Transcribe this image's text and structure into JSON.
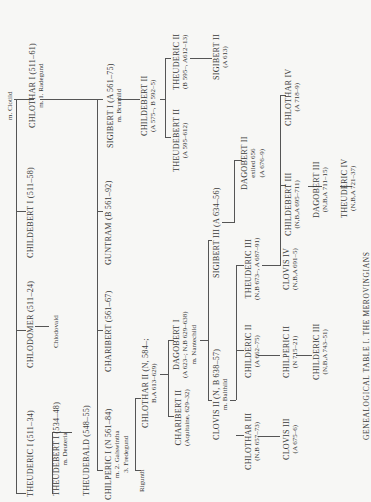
{
  "title": "GENEALOGICAL TABLE I. THE MEROVINGIANS",
  "root": {
    "marriage": "m. Clotild"
  },
  "nodes": {
    "theuderic1": {
      "name": "THEUDERIC I (511–34)"
    },
    "chlodomer": {
      "name": "CHLODOMER (511–24)"
    },
    "chlodovald": {
      "name": "Chlodovald"
    },
    "childebert1": {
      "name": "CHILDEBERT I (511–58)"
    },
    "chlothar1": {
      "name": "CHLOTHAR I (511–61)",
      "sub": "m. 1. Radegund"
    },
    "theudebert1": {
      "name": "THEUDEBERT I (534–48)",
      "sub": "m. Deuteria"
    },
    "theudebald": {
      "name": "THEUDEBALD (548–55)"
    },
    "chilperic1": {
      "name": "CHILPERIC I (N 561–84)",
      "sub": "m. 2. Galswintha",
      "sub2": "3. Fredegund"
    },
    "charibert1": {
      "name": "CHARIBERT (561–67)"
    },
    "guntram": {
      "name": "GUNTRAM (B 561–92)"
    },
    "sigibert1": {
      "name": "SIGIBERT I (A 561–75)",
      "sub": "m. Brunhild"
    },
    "rigunth": {
      "name": "Rigunth"
    },
    "chlothar2": {
      "name": "CHLOTHAR II (N, 584–;",
      "sub": "B,A 613–629)"
    },
    "childebert2": {
      "name": "CHILDEBERT II",
      "sub": "(A 575–, B 592–5)"
    },
    "theudebert2": {
      "name": "THEUDEBERT II",
      "sub": "(A 595–612)"
    },
    "theuderic2": {
      "name": "THEUDERIC II",
      "sub": "(B 595–, A612–13)"
    },
    "sigibert2": {
      "name": "SIGIBERT II",
      "sub": "(A 613)"
    },
    "charibert2": {
      "name": "CHARIBERT II",
      "sub": "(Aquitaine, 629–32)"
    },
    "dagobert1": {
      "name": "DAGOBERT I",
      "sub": "(A 623–; N,B 629–638)",
      "sub2": "m. Nantechild"
    },
    "clovis2": {
      "name": "CLOVIS II (N, B 638–57)",
      "sub": "m. Balthild"
    },
    "sigibert3": {
      "name": "SIGIBERT III (A 634–56)"
    },
    "dagobert2": {
      "name": "DAGOBERT II",
      "sub": "exiled 656",
      "sub2": "(A 676–9)"
    },
    "chlothar3": {
      "name": "CHLOTHAR III",
      "sub": "(N,B 657–73)"
    },
    "childeric2": {
      "name": "CHILDERIC II",
      "sub": "(A 662–75)"
    },
    "theuderic3": {
      "name": "THEUDERIC III",
      "sub": "(N,B 673–, A 687–91)"
    },
    "clovis3": {
      "name": "CLOVIS III",
      "sub": "(A 675–6)"
    },
    "chilperic2": {
      "name": "CHILPERIC II",
      "sub": "(N 715–21)"
    },
    "childeric3": {
      "name": "CHILDERIC III",
      "sub": "(N,B,A 743–51)"
    },
    "clovis4": {
      "name": "CLOVIS IV",
      "sub": "(N,B,A 691–5)"
    },
    "childebert3": {
      "name": "CHILDEBERT III",
      "sub": "(N,B,A 695–711)"
    },
    "dagobert3": {
      "name": "DAGOBERT III",
      "sub": "(N,B,A 711–15)"
    },
    "theuderic4": {
      "name": "THEUDERIC IV",
      "sub": "(N,B,A 721–37)"
    },
    "chlothar4": {
      "name": "CHLOTHAR IV",
      "sub": "(A 718–9)"
    }
  }
}
